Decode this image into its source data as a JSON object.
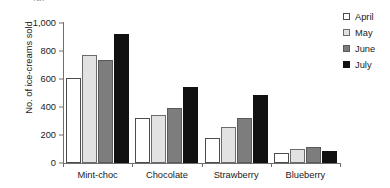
{
  "chart_data": {
    "type": "bar",
    "title": "",
    "clipped_top_text": "(a)",
    "xlabel": "",
    "ylabel": "No. of ice-creams sold",
    "categories": [
      "Mint-choc",
      "Chocolate",
      "Strawberry",
      "Blueberry"
    ],
    "series": [
      {
        "name": "April",
        "color": "#ffffff",
        "values": [
          610,
          320,
          180,
          70
        ]
      },
      {
        "name": "May",
        "color": "#e2e2e2",
        "values": [
          770,
          345,
          255,
          100
        ]
      },
      {
        "name": "June",
        "color": "#7d7d7d",
        "values": [
          735,
          395,
          325,
          115
        ]
      },
      {
        "name": "July",
        "color": "#111111",
        "values": [
          920,
          540,
          485,
          85
        ]
      }
    ],
    "ylim": [
      0,
      1000
    ],
    "yticks": [
      0,
      200,
      400,
      600,
      800,
      1000
    ],
    "ytick_labels": [
      "0",
      "200",
      "400",
      "600",
      "800",
      "1,000"
    ],
    "grid": false,
    "legend_position": "top-right",
    "legend_entries": [
      "April",
      "May",
      "June",
      "July"
    ]
  }
}
